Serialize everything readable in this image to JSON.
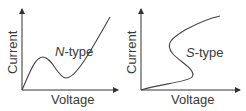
{
  "panels": [
    {
      "name": "n-type",
      "label_prefix": "N",
      "label_suffix": "-type",
      "xlabel": "Voltage",
      "ylabel": "Current"
    },
    {
      "name": "s-type",
      "label_prefix": "S",
      "label_suffix": "-type",
      "xlabel": "Voltage",
      "ylabel": "Current"
    }
  ],
  "colors": {
    "line": "#444444",
    "text": "#3a3a3a",
    "background": "#ffffff"
  }
}
